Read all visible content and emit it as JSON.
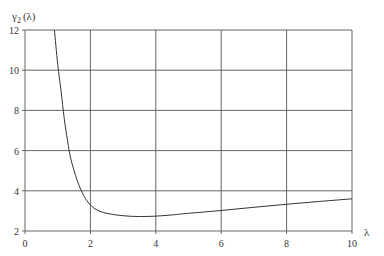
{
  "chart_data": {
    "type": "line",
    "title": "",
    "xlabel": "λ",
    "ylabel": "γ₂ (λ)",
    "ylabel_main": "γ",
    "ylabel_sub": "2",
    "ylabel_arg": "(λ)",
    "xlim": [
      0,
      10
    ],
    "ylim": [
      2,
      12
    ],
    "xticks": [
      0,
      2,
      4,
      6,
      8,
      10
    ],
    "yticks": [
      2,
      4,
      6,
      8,
      10,
      12
    ],
    "xtick_labels": [
      "0",
      "2",
      "4",
      "6",
      "8",
      "10"
    ],
    "ytick_labels": [
      "2",
      "4",
      "6",
      "8",
      "10",
      "12"
    ],
    "grid": true,
    "legend": null,
    "series": [
      {
        "name": "γ2(λ)",
        "color": "#333333",
        "x": [
          0.9,
          1.0,
          1.1,
          1.2,
          1.3,
          1.4,
          1.6,
          1.8,
          2.0,
          2.2,
          2.5,
          3.0,
          3.5,
          4.0,
          4.5,
          5.0,
          6.0,
          7.0,
          8.0,
          9.0,
          10.0
        ],
        "y": [
          12.0,
          10.3,
          9.0,
          7.6,
          6.5,
          5.6,
          4.5,
          3.75,
          3.3,
          3.05,
          2.88,
          2.76,
          2.72,
          2.74,
          2.8,
          2.88,
          3.02,
          3.18,
          3.33,
          3.47,
          3.6
        ]
      }
    ]
  }
}
